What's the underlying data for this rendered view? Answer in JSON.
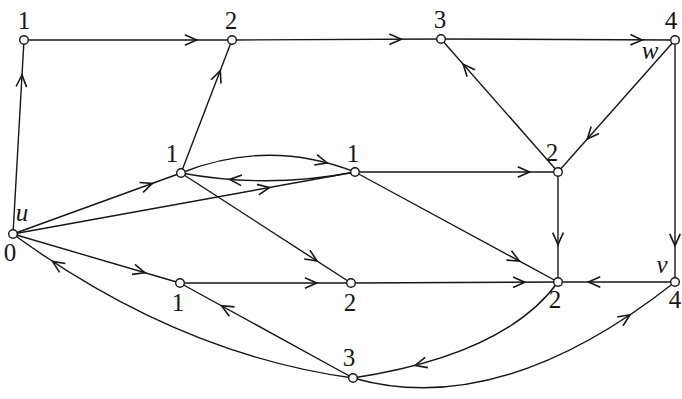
{
  "figure": {
    "background_color": "#ffffff",
    "stroke_color": "#161616",
    "node_fill_color": "#ffffff",
    "canvas": {
      "width": 682,
      "height": 399
    },
    "node_radius": 4.3,
    "edge_width": 1.4,
    "arrow_length": 13,
    "arrow_half_angle_deg": 24,
    "nodes": [
      {
        "id": "top-1",
        "x": 24,
        "y": 40,
        "value": "1"
      },
      {
        "id": "top-2",
        "x": 232,
        "y": 40,
        "value": "2"
      },
      {
        "id": "top-3",
        "x": 441,
        "y": 39,
        "value": "3"
      },
      {
        "id": "w",
        "x": 675,
        "y": 40,
        "value": "4"
      },
      {
        "id": "mid-1-left",
        "x": 181,
        "y": 173,
        "value": "1"
      },
      {
        "id": "mid-1-right",
        "x": 355,
        "y": 172,
        "value": "1"
      },
      {
        "id": "mid-2",
        "x": 558,
        "y": 172,
        "value": "2"
      },
      {
        "id": "u",
        "x": 13,
        "y": 234,
        "value": "0"
      },
      {
        "id": "bottom-1",
        "x": 180,
        "y": 283,
        "value": "1"
      },
      {
        "id": "bottom-2",
        "x": 351,
        "y": 283,
        "value": "2"
      },
      {
        "id": "bottom-2-right",
        "x": 558,
        "y": 282,
        "value": "2"
      },
      {
        "id": "v",
        "x": 675,
        "y": 282,
        "value": "4"
      },
      {
        "id": "bottom-3",
        "x": 353,
        "y": 378,
        "value": "3"
      }
    ],
    "labels": [
      {
        "text": "1",
        "x": 24,
        "y": 29,
        "italic": false,
        "for": "top-1"
      },
      {
        "text": "2",
        "x": 231,
        "y": 29,
        "italic": false,
        "for": "top-2"
      },
      {
        "text": "3",
        "x": 440,
        "y": 28,
        "italic": false,
        "for": "top-3"
      },
      {
        "text": "4",
        "x": 671,
        "y": 29,
        "italic": false,
        "for": "w"
      },
      {
        "text": "w",
        "x": 650,
        "y": 59,
        "italic": true,
        "for": "w"
      },
      {
        "text": "1",
        "x": 172,
        "y": 162,
        "italic": false,
        "for": "mid-1-left"
      },
      {
        "text": "1",
        "x": 353,
        "y": 162,
        "italic": false,
        "for": "mid-1-right"
      },
      {
        "text": "2",
        "x": 552,
        "y": 161,
        "italic": false,
        "for": "mid-2"
      },
      {
        "text": "u",
        "x": 22,
        "y": 221,
        "italic": true,
        "for": "u"
      },
      {
        "text": "0",
        "x": 10,
        "y": 261,
        "italic": false,
        "for": "u"
      },
      {
        "text": "1",
        "x": 178,
        "y": 311,
        "italic": false,
        "for": "bottom-1"
      },
      {
        "text": "2",
        "x": 350,
        "y": 311,
        "italic": false,
        "for": "bottom-2"
      },
      {
        "text": "2",
        "x": 555,
        "y": 308,
        "italic": false,
        "for": "bottom-2-right"
      },
      {
        "text": "v",
        "x": 662,
        "y": 273,
        "italic": true,
        "for": "v"
      },
      {
        "text": "4",
        "x": 675,
        "y": 308,
        "italic": false,
        "for": "v"
      },
      {
        "text": "3",
        "x": 349,
        "y": 366,
        "italic": false,
        "for": "bottom-3"
      }
    ],
    "edges": [
      {
        "from": "top-1",
        "to": "top-2",
        "arrow_t": 0.83
      },
      {
        "from": "top-2",
        "to": "top-3",
        "arrow_t": 0.81
      },
      {
        "from": "top-3",
        "to": "w",
        "arrow_t": 0.86
      },
      {
        "from": "u",
        "to": "top-1",
        "arrow_t": 0.82
      },
      {
        "from": "mid-1-left",
        "to": "top-2",
        "arrow_t": 0.77
      },
      {
        "from": "mid-2",
        "to": "top-3",
        "arrow_t": 0.81
      },
      {
        "from": "w",
        "to": "mid-2",
        "arrow_t": 0.75
      },
      {
        "from": "w",
        "to": "v",
        "arrow_t": 0.85
      },
      {
        "from": "mid-1-left",
        "to": "mid-1-right",
        "ctrl": [
          268,
          138
        ],
        "arrow_t": 0.84
      },
      {
        "from": "mid-1-right",
        "to": "mid-1-left",
        "ctrl": [
          268,
          189
        ],
        "arrow_t": 0.72
      },
      {
        "from": "u",
        "to": "mid-1-left",
        "arrow_t": 0.83
      },
      {
        "from": "u",
        "to": "mid-1-right",
        "arrow_t": 0.75
      },
      {
        "from": "mid-1-right",
        "to": "mid-2",
        "arrow_t": 0.86
      },
      {
        "from": "mid-1-left",
        "to": "bottom-2",
        "arrow_t": 0.8
      },
      {
        "from": "mid-1-right",
        "to": "bottom-2-right",
        "arrow_t": 0.81
      },
      {
        "from": "mid-2",
        "to": "bottom-2-right",
        "arrow_t": 0.66
      },
      {
        "from": "bottom-2",
        "to": "bottom-2-right",
        "arrow_t": 0.84
      },
      {
        "from": "v",
        "to": "bottom-2-right",
        "arrow_t": 0.74
      },
      {
        "from": "bottom-2-right",
        "to": "bottom-3",
        "ctrl": [
          505,
          355
        ],
        "arrow_t": 0.78
      },
      {
        "from": "bottom-3",
        "to": "v",
        "ctrl": [
          500,
          420
        ],
        "arrow_t": 0.87
      },
      {
        "from": "bottom-3",
        "to": "bottom-1",
        "arrow_t": 0.76
      },
      {
        "from": "bottom-3",
        "to": "u",
        "ctrl": [
          177,
          354
        ],
        "arrow_t": 0.88
      },
      {
        "from": "u",
        "to": "bottom-1",
        "arrow_t": 0.79
      },
      {
        "from": "bottom-1",
        "to": "bottom-2",
        "arrow_t": 0.8
      }
    ]
  }
}
